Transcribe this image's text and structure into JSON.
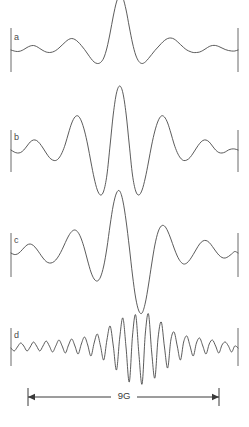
{
  "figure": {
    "type": "multi-panel-spectrum",
    "background_color": "#ffffff",
    "trace_color": "#4a4a4a",
    "axis_color": "#6a6a6a",
    "scale_color": "#3a3a3a",
    "width": 249,
    "height": 427
  },
  "scale_bar": {
    "label": "9G",
    "x_start": 28,
    "x_end": 219,
    "y": 397,
    "label_x": 124,
    "label_y": 399
  },
  "chart_data": {
    "type": "line",
    "title": "",
    "subtitle": "",
    "xlabel": "",
    "ylabel": "",
    "grid": false,
    "legend": "none",
    "axis_span_label": "9G",
    "x_axis_range_gauss": [
      0,
      9
    ],
    "panel_count": 4,
    "panels": [
      {
        "label": "a",
        "label_x": 14,
        "label_y": 40,
        "baseline_y": 50,
        "tick_x_left": 11,
        "tick_x_right": 238,
        "tick_top": 28,
        "tick_bottom": 72,
        "amplitude_scale": 1.0,
        "x_start": 11,
        "x_end": 238,
        "description": "Low-frequency wiggle with one tall narrow central peak flanked by two shallow minima",
        "values": [
          0,
          -1,
          -1.5,
          -1,
          0.5,
          2.5,
          4,
          4.5,
          3.5,
          1.5,
          -0.5,
          -2,
          -2.5,
          -2,
          -0.5,
          2,
          5,
          8,
          10.5,
          11.5,
          10.5,
          8,
          4.5,
          0.5,
          -4,
          -8.5,
          -12,
          -13.5,
          -12.5,
          -8,
          2,
          17,
          34,
          48,
          55,
          52,
          40,
          23,
          7,
          -5,
          -11.5,
          -13.5,
          -12,
          -8.5,
          -4.5,
          -0.5,
          3,
          6.5,
          9.5,
          11.5,
          12,
          11,
          8.5,
          5.5,
          2.5,
          0,
          -1.5,
          -2.5,
          -2.5,
          -2,
          -0.5,
          1.5,
          3.5,
          4.5,
          4.5,
          3.5,
          2,
          0.5,
          -0.5,
          -1,
          -1,
          0
        ]
      },
      {
        "label": "b",
        "label_x": 14,
        "label_y": 140,
        "baseline_y": 150,
        "tick_x_left": 11,
        "tick_x_right": 238,
        "tick_top": 130,
        "tick_bottom": 172,
        "amplitude_scale": 1.0,
        "x_start": 11,
        "x_end": 238,
        "description": "Symmetric pattern, tall central peak with two deep flanking minima and pronounced side lobes",
        "values": [
          0,
          -2,
          -3,
          -2.5,
          0,
          4,
          8,
          10,
          9.5,
          6.5,
          2,
          -3,
          -7.5,
          -10,
          -10.5,
          -8,
          -2.5,
          6,
          17,
          27,
          33,
          34,
          29,
          19,
          5,
          -12,
          -28,
          -40,
          -45,
          -41,
          -25,
          5,
          36,
          57,
          64,
          57,
          36,
          5,
          -25,
          -41,
          -45,
          -40,
          -28,
          -12,
          5,
          19,
          29,
          34,
          33,
          27,
          17,
          6,
          -2.5,
          -8,
          -10.5,
          -10,
          -7.5,
          -3,
          2,
          6.5,
          9.5,
          10,
          8,
          4,
          0,
          -2.5,
          -3,
          -2,
          0,
          1,
          1,
          0
        ]
      },
      {
        "label": "c",
        "label_x": 14,
        "label_y": 243,
        "baseline_y": 253,
        "tick_x_left": 11,
        "tick_x_right": 238,
        "tick_top": 233,
        "tick_bottom": 277,
        "amplitude_scale": 1.0,
        "x_start": 11,
        "x_end": 238,
        "description": "Asymmetric derivative-like shape: tall central peak immediately followed by a very deep trough",
        "values": [
          0,
          -1.5,
          -1,
          1.5,
          5,
          8,
          9,
          7.5,
          4,
          -0.5,
          -5,
          -8.5,
          -10,
          -9.5,
          -7,
          -2.5,
          3.5,
          10.5,
          17,
          21.5,
          23,
          20.5,
          14,
          4,
          -8,
          -19,
          -26,
          -28,
          -24,
          -13,
          5,
          28,
          48,
          60,
          62,
          52,
          32,
          6,
          -22,
          -45,
          -58,
          -60,
          -50,
          -32,
          -11,
          8,
          21,
          27,
          27,
          22,
          14,
          5,
          -3,
          -8.5,
          -11,
          -10,
          -6.5,
          -1.5,
          4,
          9,
          12,
          12.5,
          10.5,
          6.5,
          2,
          -2,
          -4.5,
          -5,
          -3.5,
          -1,
          1.5,
          0
        ]
      },
      {
        "label": "d",
        "label_x": 14,
        "label_y": 338,
        "baseline_y": 348,
        "tick_x_left": 11,
        "tick_x_right": 238,
        "tick_top": 328,
        "tick_bottom": 366,
        "amplitude_scale": 1.0,
        "x_start": 11,
        "x_end": 238,
        "description": "High-frequency oscillation with two deep central troughs separated by a narrow spike",
        "values": [
          0,
          -3,
          1,
          5,
          2,
          -3,
          1,
          6,
          2,
          -3,
          2,
          7,
          2,
          -4,
          2,
          8,
          2,
          -5,
          3,
          9,
          2,
          -6,
          4,
          11,
          3,
          -8,
          5,
          14,
          2,
          -12,
          8,
          22,
          2,
          -22,
          10,
          30,
          0,
          -34,
          12,
          33,
          -6,
          -36,
          14,
          34,
          -4,
          -30,
          10,
          26,
          1,
          -20,
          8,
          16,
          2,
          -12,
          6,
          12,
          2,
          -8,
          5,
          10,
          2,
          -6,
          4,
          8,
          2,
          -5,
          3,
          6,
          2,
          -4,
          2,
          0
        ]
      }
    ]
  }
}
